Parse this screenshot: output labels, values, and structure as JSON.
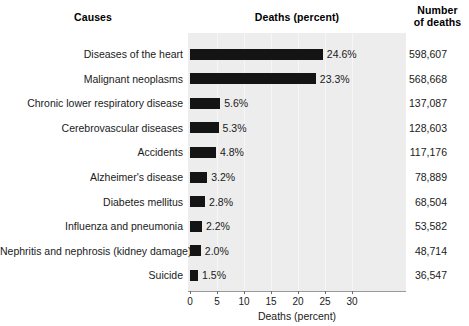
{
  "headers": {
    "causes": "Causes",
    "deaths_percent": "Deaths (percent)",
    "number_line1": "Number",
    "number_line2": "of deaths"
  },
  "axis": {
    "title": "Deaths (percent)",
    "ticks": [
      "0",
      "5",
      "10",
      "15",
      "20",
      "25",
      "30"
    ]
  },
  "colors": {
    "bar": "#141414",
    "panel": "#ededed",
    "text": "#1a1a1a",
    "background": "#ffffff"
  },
  "chart_data": {
    "type": "bar",
    "orientation": "horizontal",
    "title": "",
    "xlabel": "Deaths (percent)",
    "ylabel": "Causes",
    "xlim": [
      0,
      30
    ],
    "xticks": [
      0,
      5,
      10,
      15,
      20,
      25,
      30
    ],
    "grid": true,
    "legend": "none",
    "categories": [
      "Diseases of the heart",
      "Malignant neoplasms",
      "Chronic lower respiratory disease",
      "Cerebrovascular diseases",
      "Accidents",
      "Alzheimer's disease",
      "Diabetes mellitus",
      "Influenza and pneumonia",
      "Nephritis and nephrosis (kidney damage)",
      "Suicide"
    ],
    "values": [
      24.6,
      23.3,
      5.6,
      5.3,
      4.8,
      3.2,
      2.8,
      2.2,
      2.0,
      1.5
    ],
    "value_labels": [
      "24.6%",
      "23.3%",
      "5.6%",
      "5.3%",
      "4.8%",
      "3.2%",
      "2.8%",
      "2.2%",
      "2.0%",
      "1.5%"
    ],
    "secondary_column": {
      "name": "Number of deaths",
      "values": [
        598607,
        568668,
        137087,
        128603,
        117176,
        78889,
        68504,
        53582,
        48714,
        36547
      ],
      "labels": [
        "598,607",
        "568,668",
        "137,087",
        "128,603",
        "117,176",
        "78,889",
        "68,504",
        "53,582",
        "48,714",
        "36,547"
      ]
    }
  }
}
